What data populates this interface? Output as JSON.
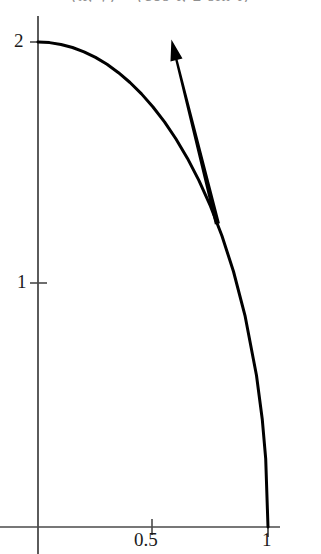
{
  "figure": {
    "width": 321,
    "height": 554,
    "background": "#ffffff",
    "curve_color": "#000000",
    "axis_color": "#4a4a4a",
    "label_color": "#1a1a1a",
    "clipped_caption_text": "(x, y) = (cos t, 2 sin t)"
  },
  "axes": {
    "x": {
      "tick_labels": [
        "0.5",
        "1"
      ],
      "tick_values": [
        0.5,
        1
      ],
      "range": [
        0,
        1.05
      ],
      "origin_label": ""
    },
    "y": {
      "tick_labels": [
        "1",
        "2"
      ],
      "tick_values": [
        1,
        2
      ],
      "range": [
        0,
        2.12
      ],
      "origin_label": ""
    }
  },
  "labels": {
    "y_two": "2",
    "y_one": "1",
    "x_half": "0.5",
    "x_one": "1"
  },
  "chart_data": {
    "type": "line",
    "title": "",
    "xlabel": "",
    "ylabel": "",
    "xlim": [
      0,
      1.05
    ],
    "ylim": [
      0,
      2.12
    ],
    "grid": false,
    "legend": "none",
    "xticks": [
      0.5,
      1
    ],
    "xticklabels": [
      "0.5",
      "1"
    ],
    "yticks": [
      1,
      2
    ],
    "yticklabels": [
      "1",
      "2"
    ],
    "series": [
      {
        "name": "quarter-ellipse",
        "equation": "y = 2*sqrt(1 - x^2)",
        "linewidth": 3,
        "color": "#000000",
        "x": [
          0,
          0.05,
          0.1,
          0.15,
          0.2,
          0.25,
          0.3,
          0.35,
          0.4,
          0.45,
          0.5,
          0.55,
          0.6,
          0.65,
          0.7,
          0.75,
          0.8,
          0.85,
          0.9,
          0.95,
          0.975,
          0.99,
          1
        ],
        "y": [
          2,
          1.9975,
          1.99,
          1.9774,
          1.9596,
          1.9365,
          1.9079,
          1.8735,
          1.833,
          1.7861,
          1.7321,
          1.6703,
          1.6,
          1.5199,
          1.4283,
          1.3229,
          1.2,
          1.0536,
          0.8718,
          0.6245,
          0.4444,
          0.2821,
          0
        ]
      }
    ],
    "annotations": [
      {
        "type": "arrow",
        "name": "tangent-direction-arrow",
        "description": "thick tapered arrow pointing up-left along the curve tangent direction",
        "tail": [
          0.78,
          1.25
        ],
        "head": [
          0.58,
          2.01
        ],
        "color": "#000000"
      }
    ]
  }
}
